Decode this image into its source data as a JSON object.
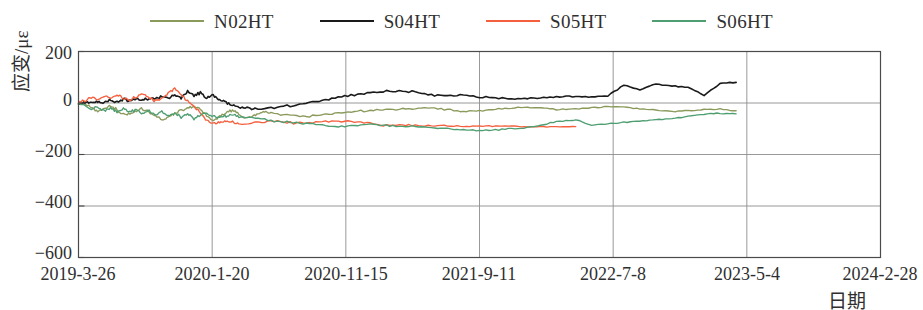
{
  "chart_data": {
    "type": "line",
    "title": "",
    "xlabel": "日期",
    "ylabel": "应变/με",
    "ylim": [
      -600,
      200
    ],
    "yticks": [
      200,
      0,
      -200,
      -400,
      -600
    ],
    "xtick_labels": [
      "2019-3-26",
      "2020-1-20",
      "2020-11-15",
      "2021-9-11",
      "2022-7-8",
      "2023-5-4",
      "2024-2-28"
    ],
    "grid": true,
    "legend_position": "top-center",
    "colors": {
      "N02HT": "#8a9a5b",
      "S04HT": "#1a1a1a",
      "S05HT": "#f4603e",
      "S06HT": "#4e9e72"
    },
    "series": [
      {
        "name": "N02HT",
        "color": "#8a9a5b",
        "x": [
          0,
          0.008,
          0.016,
          0.024,
          0.032,
          0.04,
          0.048,
          0.056,
          0.064,
          0.072,
          0.08,
          0.088,
          0.096,
          0.104,
          0.112,
          0.12,
          0.128,
          0.136,
          0.144,
          0.152,
          0.16,
          0.168,
          0.176,
          0.184,
          0.192,
          0.2,
          0.208,
          0.216,
          0.224,
          0.232,
          0.24,
          0.26,
          0.28,
          0.3,
          0.32,
          0.34,
          0.36,
          0.38,
          0.4,
          0.42,
          0.44,
          0.46,
          0.48,
          0.5,
          0.52,
          0.54,
          0.56,
          0.58,
          0.6,
          0.62,
          0.64,
          0.66,
          0.68,
          0.7,
          0.72,
          0.74,
          0.76,
          0.78,
          0.8,
          0.82
        ],
        "y": [
          0,
          -6,
          -18,
          -30,
          -22,
          -12,
          -26,
          -45,
          -40,
          -30,
          -22,
          -36,
          -52,
          -64,
          -55,
          -40,
          -30,
          -20,
          -12,
          -24,
          -48,
          -66,
          -54,
          -38,
          -28,
          -42,
          -60,
          -52,
          -40,
          -34,
          -40,
          -46,
          -52,
          -48,
          -40,
          -34,
          -30,
          -26,
          -24,
          -22,
          -20,
          -26,
          -34,
          -30,
          -24,
          -20,
          -18,
          -20,
          -26,
          -24,
          -18,
          -14,
          -16,
          -22,
          -28,
          -34,
          -30,
          -26,
          -24,
          -30
        ]
      },
      {
        "name": "S04HT",
        "color": "#1a1a1a",
        "x": [
          0,
          0.008,
          0.016,
          0.024,
          0.032,
          0.04,
          0.048,
          0.056,
          0.064,
          0.072,
          0.08,
          0.088,
          0.096,
          0.104,
          0.112,
          0.12,
          0.128,
          0.136,
          0.144,
          0.152,
          0.16,
          0.168,
          0.176,
          0.184,
          0.192,
          0.2,
          0.21,
          0.22,
          0.24,
          0.26,
          0.28,
          0.3,
          0.32,
          0.34,
          0.36,
          0.38,
          0.4,
          0.42,
          0.44,
          0.46,
          0.48,
          0.5,
          0.52,
          0.54,
          0.56,
          0.58,
          0.6,
          0.62,
          0.64,
          0.66,
          0.68,
          0.7,
          0.72,
          0.74,
          0.76,
          0.78,
          0.8,
          0.82
        ],
        "y": [
          0,
          4,
          0,
          6,
          2,
          10,
          4,
          14,
          8,
          18,
          10,
          20,
          14,
          28,
          16,
          34,
          20,
          46,
          28,
          40,
          20,
          30,
          10,
          2,
          -8,
          -14,
          -20,
          -22,
          -18,
          -12,
          -4,
          8,
          20,
          30,
          38,
          44,
          46,
          44,
          30,
          26,
          34,
          24,
          20,
          16,
          18,
          22,
          24,
          26,
          24,
          28,
          70,
          52,
          74,
          66,
          62,
          30,
          76,
          80
        ]
      },
      {
        "name": "S05HT",
        "color": "#f4603e",
        "x": [
          0,
          0.008,
          0.016,
          0.024,
          0.032,
          0.04,
          0.048,
          0.056,
          0.064,
          0.072,
          0.08,
          0.088,
          0.096,
          0.104,
          0.112,
          0.12,
          0.128,
          0.136,
          0.144,
          0.152,
          0.16,
          0.168,
          0.176,
          0.184,
          0.192,
          0.2,
          0.22,
          0.24,
          0.26,
          0.28,
          0.3,
          0.32,
          0.34,
          0.36,
          0.38,
          0.4,
          0.42,
          0.44,
          0.46,
          0.48,
          0.5,
          0.52,
          0.54,
          0.56,
          0.58,
          0.6,
          0.62
        ],
        "y": [
          0,
          10,
          20,
          14,
          26,
          18,
          30,
          20,
          10,
          24,
          34,
          20,
          8,
          18,
          40,
          56,
          30,
          10,
          -10,
          -40,
          -70,
          -80,
          -74,
          -70,
          -74,
          -80,
          -76,
          -70,
          -74,
          -80,
          -74,
          -70,
          -72,
          -78,
          -86,
          -84,
          -86,
          -88,
          -88,
          -90,
          -90,
          -90,
          -90,
          -92,
          -92,
          -92,
          -92
        ]
      },
      {
        "name": "S06HT",
        "color": "#4e9e72",
        "x": [
          0,
          0.008,
          0.016,
          0.024,
          0.032,
          0.04,
          0.048,
          0.056,
          0.064,
          0.072,
          0.08,
          0.088,
          0.096,
          0.104,
          0.112,
          0.12,
          0.128,
          0.136,
          0.144,
          0.152,
          0.16,
          0.168,
          0.176,
          0.184,
          0.192,
          0.2,
          0.22,
          0.24,
          0.26,
          0.28,
          0.3,
          0.32,
          0.34,
          0.36,
          0.38,
          0.4,
          0.42,
          0.44,
          0.46,
          0.48,
          0.5,
          0.52,
          0.54,
          0.56,
          0.58,
          0.6,
          0.62,
          0.64,
          0.66,
          0.68,
          0.7,
          0.72,
          0.74,
          0.76,
          0.78,
          0.8,
          0.82
        ],
        "y": [
          0,
          -10,
          -24,
          -16,
          -30,
          -20,
          -34,
          -22,
          -36,
          -26,
          -40,
          -30,
          -48,
          -34,
          -52,
          -38,
          -56,
          -42,
          -60,
          -46,
          -40,
          -50,
          -58,
          -50,
          -44,
          -52,
          -60,
          -68,
          -74,
          -80,
          -86,
          -92,
          -88,
          -84,
          -86,
          -90,
          -92,
          -96,
          -100,
          -104,
          -106,
          -104,
          -100,
          -96,
          -84,
          -70,
          -66,
          -86,
          -80,
          -76,
          -70,
          -66,
          -60,
          -52,
          -44,
          -40,
          -42
        ]
      }
    ]
  },
  "legend": {
    "items": [
      {
        "label": "N02HT",
        "color": "#8a9a5b"
      },
      {
        "label": "S04HT",
        "color": "#1a1a1a"
      },
      {
        "label": "S05HT",
        "color": "#f4603e"
      },
      {
        "label": "S06HT",
        "color": "#4e9e72"
      }
    ]
  },
  "axes": {
    "y_title": "应变/με",
    "x_title": "日期",
    "y_ticks": [
      "200",
      "0",
      "−200",
      "−400",
      "−600"
    ],
    "x_ticks": [
      "2019-3-26",
      "2020-1-20",
      "2020-11-15",
      "2021-9-11",
      "2022-7-8",
      "2023-5-4",
      "2024-2-28"
    ]
  }
}
